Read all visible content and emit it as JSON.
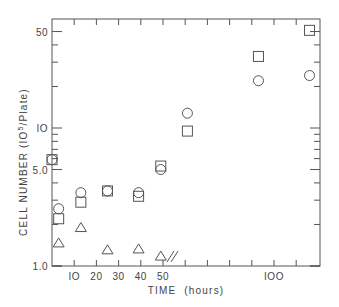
{
  "chart_data": {
    "type": "scatter",
    "title": "",
    "xlabel": "TIME  (hours)",
    "ylabel": "CELL NUMBER (10^5/Plate)",
    "ylabel_parts": {
      "main": "CELL NUMBER (IO",
      "sup": "5",
      "tail": "/Plate)"
    },
    "yscale": "log",
    "ylim": [
      1.0,
      60
    ],
    "xlim": [
      0,
      121
    ],
    "x_break_marker": "//",
    "x_break_after": 50,
    "grid": false,
    "legend": null,
    "x_ticks": [
      10,
      20,
      30,
      40,
      50,
      60,
      70,
      80,
      90,
      100,
      110
    ],
    "x_tick_labels": [
      {
        "value": 10,
        "label": "IO"
      },
      {
        "value": 20,
        "label": "20"
      },
      {
        "value": 30,
        "label": "30"
      },
      {
        "value": 40,
        "label": "40"
      },
      {
        "value": 50,
        "label": "50"
      },
      {
        "value": 100,
        "label": "IOO"
      }
    ],
    "y_tick_labels": [
      {
        "value": 1.0,
        "label": "1.0"
      },
      {
        "value": 5.0,
        "label": "5.0"
      },
      {
        "value": 10,
        "label": "IO"
      },
      {
        "value": 50,
        "label": "50"
      }
    ],
    "y_minor_ticks": [
      2,
      3,
      4,
      6,
      7,
      8,
      9,
      20,
      30,
      40
    ],
    "series": [
      {
        "name": "circles",
        "marker": "circle",
        "points": [
          {
            "x": 0,
            "y": 5.9
          },
          {
            "x": 3,
            "y": 2.6
          },
          {
            "x": 13,
            "y": 3.4
          },
          {
            "x": 25,
            "y": 3.5
          },
          {
            "x": 39,
            "y": 3.4
          },
          {
            "x": 49,
            "y": 5.0
          },
          {
            "x": 61,
            "y": 12.8
          },
          {
            "x": 93,
            "y": 22
          },
          {
            "x": 116,
            "y": 24
          }
        ]
      },
      {
        "name": "squares",
        "marker": "square",
        "points": [
          {
            "x": 0,
            "y": 5.9
          },
          {
            "x": 3,
            "y": 2.2
          },
          {
            "x": 13,
            "y": 2.9
          },
          {
            "x": 25,
            "y": 3.5
          },
          {
            "x": 39,
            "y": 3.2
          },
          {
            "x": 49,
            "y": 5.3
          },
          {
            "x": 61,
            "y": 9.5
          },
          {
            "x": 93,
            "y": 33
          },
          {
            "x": 116,
            "y": 51
          }
        ]
      },
      {
        "name": "triangles",
        "marker": "triangle",
        "points": [
          {
            "x": 3,
            "y": 1.47
          },
          {
            "x": 13,
            "y": 1.9
          },
          {
            "x": 25,
            "y": 1.31
          },
          {
            "x": 39,
            "y": 1.33
          },
          {
            "x": 49,
            "y": 1.18
          }
        ]
      }
    ]
  },
  "colors": {
    "ink": "#555555",
    "background": "#ffffff"
  }
}
